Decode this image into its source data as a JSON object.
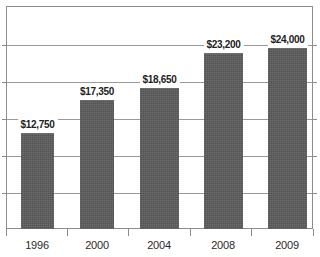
{
  "chart_data": {
    "type": "bar",
    "title": "",
    "subtitle": "",
    "xlabel": "",
    "ylabel": "",
    "categories": [
      "1996",
      "2000",
      "2004",
      "2008",
      "2009"
    ],
    "values": [
      12750,
      17350,
      18650,
      23200,
      24000
    ],
    "data_labels": [
      "$12,750",
      "$17,350",
      "$18,650",
      "$23,200",
      "$24,000"
    ],
    "ylim": [
      0,
      30000
    ],
    "y_tick_step": 5000,
    "y_tick_labels": [],
    "grid": true,
    "gridlines": 6,
    "legend": null,
    "legend_position": "none",
    "series": [
      {
        "name": "",
        "values": [
          12750,
          17350,
          18650,
          23200,
          24000
        ],
        "color": "#5b5b5b"
      }
    ],
    "colors": {
      "bar_fill": "#5b5b5b",
      "gridline": "#9a9a9a",
      "axis": "#8d8d8d",
      "label_text": "#222222",
      "category_text": "#2b2b2b",
      "background": "#ffffff"
    }
  },
  "bars": [
    {
      "category": "1996",
      "label": "$12,750",
      "value": 12750,
      "left": 21,
      "width": 33,
      "top": 133
    },
    {
      "category": "2000",
      "label": "$17,350",
      "value": 17350,
      "left": 80,
      "width": 34,
      "top": 100
    },
    {
      "category": "2004",
      "label": "$18,650",
      "value": 18650,
      "left": 140,
      "width": 39,
      "top": 88
    },
    {
      "category": "2008",
      "label": "$23,200",
      "value": 23200,
      "left": 204,
      "width": 39,
      "top": 53
    },
    {
      "category": "2009",
      "label": "$24,000",
      "value": 24000,
      "left": 268,
      "width": 39,
      "top": 48
    }
  ],
  "gridline_positions": [
    44,
    81,
    118,
    155,
    192
  ],
  "x_tick_positions": [
    6,
    67,
    128,
    190,
    251,
    313
  ],
  "category_centers": [
    37,
    97,
    159,
    223,
    287
  ]
}
